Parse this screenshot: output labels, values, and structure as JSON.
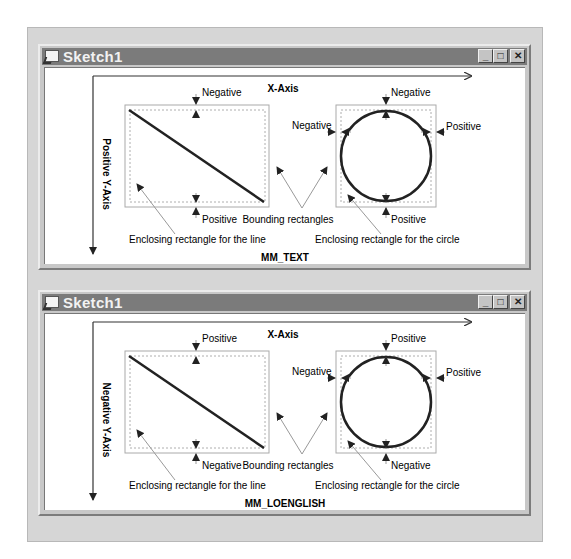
{
  "windows": [
    {
      "title": "Sketch1",
      "mapping_mode": "MM_TEXT",
      "x_axis_label": "X-Axis",
      "y_axis_label": "Positive Y-Axis",
      "line_rect": {
        "top_label": "Negative",
        "bottom_label": "Positive"
      },
      "circle_rect": {
        "top_label": "Negative",
        "bottom_label": "Positive",
        "left_label": "Negative",
        "right_label": "Positive"
      },
      "bounding_label": "Bounding rectangles",
      "enclosing_line_label": "Enclosing rectangle for the line",
      "enclosing_circle_label": "Enclosing rectangle for the circle"
    },
    {
      "title": "Sketch1",
      "mapping_mode": "MM_LOENGLISH",
      "x_axis_label": "X-Axis",
      "y_axis_label": "Negative Y-Axis",
      "line_rect": {
        "top_label": "Positive",
        "bottom_label": "Negative"
      },
      "circle_rect": {
        "top_label": "Positive",
        "bottom_label": "Negative",
        "left_label": "Negative",
        "right_label": "Positive"
      },
      "bounding_label": "Bounding rectangles",
      "enclosing_line_label": "Enclosing rectangle for the line",
      "enclosing_circle_label": "Enclosing rectangle for the circle"
    }
  ],
  "window_buttons": {
    "minimize": "_",
    "maximize": "□",
    "close": "✕"
  },
  "colors": {
    "titlebar": "#7b7b7b",
    "frame": "#c8c8c8",
    "panel": "#d6d6d6",
    "drawing": "#222222",
    "guide": "#999999"
  }
}
